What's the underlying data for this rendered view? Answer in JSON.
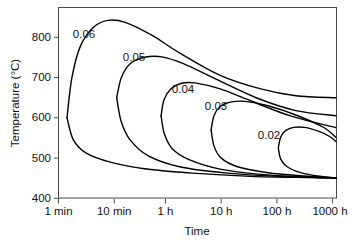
{
  "chart_data": {
    "type": "line",
    "title": "",
    "xlabel": "Time",
    "ylabel": "Temperature (°C)",
    "x_scale": "log",
    "x_tick_labels": [
      "1 min",
      "10 min",
      "1 h",
      "10 h",
      "100 h",
      "1000 h"
    ],
    "y_tick_labels": [
      "400",
      "500",
      "600",
      "700",
      "800"
    ],
    "y_tick_values": [
      400,
      500,
      600,
      700,
      800
    ],
    "ylim": [
      400,
      875
    ],
    "grid": false,
    "legend": "inline-curve-labels",
    "series": [
      {
        "name": "0.06",
        "label": "0.06",
        "label_position": {
          "time": "1 min",
          "temperature": 832
        },
        "nose_time": "1.4 min",
        "nose_temperature": 600,
        "peak_temperature": 843,
        "upper_branch_end_temperature": 650,
        "lower_branch_end_temperature": 450,
        "points_upper": [
          {
            "t": 1.4,
            "T": 600
          },
          {
            "t": 1.7,
            "T": 700
          },
          {
            "t": 2.4,
            "T": 780
          },
          {
            "t": 4.0,
            "T": 826
          },
          {
            "t": 7.0,
            "T": 843
          },
          {
            "t": 14.0,
            "T": 838
          },
          {
            "t": 40.0,
            "T": 806
          },
          {
            "t": 120.0,
            "T": 762
          },
          {
            "t": 600.0,
            "T": 706
          },
          {
            "t": 3000.0,
            "T": 672
          },
          {
            "t": 12000.0,
            "T": 655
          },
          {
            "t": 60000.0,
            "T": 650
          }
        ],
        "points_lower": [
          {
            "t": 1.4,
            "T": 600
          },
          {
            "t": 1.8,
            "T": 545
          },
          {
            "t": 3.0,
            "T": 512
          },
          {
            "t": 8.0,
            "T": 489
          },
          {
            "t": 30.0,
            "T": 473
          },
          {
            "t": 200.0,
            "T": 462
          },
          {
            "t": 2000.0,
            "T": 454
          },
          {
            "t": 20000.0,
            "T": 451
          },
          {
            "t": 60000.0,
            "T": 450
          }
        ]
      },
      {
        "name": "0.05",
        "label": "0.05",
        "label_position": {
          "time": "8 min",
          "temperature": 775
        },
        "nose_time": "10 min",
        "nose_temperature": 650,
        "peak_temperature": 752,
        "upper_branch_end_temperature": 605,
        "lower_branch_end_temperature": 450,
        "points_upper": [
          {
            "t": 10.0,
            "T": 650
          },
          {
            "t": 12.0,
            "T": 700
          },
          {
            "t": 17.0,
            "T": 735
          },
          {
            "t": 30.0,
            "T": 751
          },
          {
            "t": 60.0,
            "T": 752
          },
          {
            "t": 140.0,
            "T": 735
          },
          {
            "t": 500.0,
            "T": 697
          },
          {
            "t": 2500.0,
            "T": 650
          },
          {
            "t": 12000.0,
            "T": 618
          },
          {
            "t": 60000.0,
            "T": 605
          }
        ],
        "points_lower": [
          {
            "t": 10.0,
            "T": 650
          },
          {
            "t": 12.0,
            "T": 590
          },
          {
            "t": 17.0,
            "T": 545
          },
          {
            "t": 35.0,
            "T": 505
          },
          {
            "t": 120.0,
            "T": 478
          },
          {
            "t": 800.0,
            "T": 462
          },
          {
            "t": 6000.0,
            "T": 454
          },
          {
            "t": 60000.0,
            "T": 450
          }
        ]
      },
      {
        "name": "0.04",
        "label": "0.04",
        "label_position": {
          "time": "45 min",
          "temperature": 707
        },
        "nose_time": "1 h",
        "nose_temperature": 605,
        "peak_temperature": 687,
        "upper_branch_end_temperature": 575,
        "lower_branch_end_temperature": 450,
        "points_upper": [
          {
            "t": 58.0,
            "T": 605
          },
          {
            "t": 65.0,
            "T": 645
          },
          {
            "t": 85.0,
            "T": 672
          },
          {
            "t": 130.0,
            "T": 686
          },
          {
            "t": 220.0,
            "T": 687
          },
          {
            "t": 600.0,
            "T": 672
          },
          {
            "t": 2200.0,
            "T": 640
          },
          {
            "t": 10000.0,
            "T": 604
          },
          {
            "t": 60000.0,
            "T": 575
          }
        ],
        "points_lower": [
          {
            "t": 58.0,
            "T": 605
          },
          {
            "t": 66.0,
            "T": 560
          },
          {
            "t": 90.0,
            "T": 523
          },
          {
            "t": 180.0,
            "T": 495
          },
          {
            "t": 600.0,
            "T": 472
          },
          {
            "t": 3000.0,
            "T": 459
          },
          {
            "t": 20000.0,
            "T": 452
          },
          {
            "t": 60000.0,
            "T": 450
          }
        ]
      },
      {
        "name": "0.03",
        "label": "0.03",
        "label_position": {
          "time": "4 h",
          "temperature": 663
        },
        "nose_time": "7 h",
        "nose_temperature": 570,
        "peak_temperature": 641,
        "upper_branch_end_temperature": 550,
        "lower_branch_end_temperature": 450,
        "points_upper": [
          {
            "t": 420.0,
            "T": 570
          },
          {
            "t": 470.0,
            "T": 605
          },
          {
            "t": 600.0,
            "T": 628
          },
          {
            "t": 900.0,
            "T": 639
          },
          {
            "t": 1600.0,
            "T": 641
          },
          {
            "t": 4000.0,
            "T": 630
          },
          {
            "t": 12000.0,
            "T": 607
          },
          {
            "t": 35000.0,
            "T": 577
          },
          {
            "t": 60000.0,
            "T": 550
          }
        ],
        "points_lower": [
          {
            "t": 420.0,
            "T": 570
          },
          {
            "t": 470.0,
            "T": 530
          },
          {
            "t": 620.0,
            "T": 500
          },
          {
            "t": 1200.0,
            "T": 478
          },
          {
            "t": 4000.0,
            "T": 463
          },
          {
            "t": 16000.0,
            "T": 455
          },
          {
            "t": 60000.0,
            "T": 450
          }
        ]
      },
      {
        "name": "0.02",
        "label": "0.02",
        "label_position": {
          "time": "70 h",
          "temperature": 592
        },
        "nose_time": "100 h",
        "nose_temperature": 525,
        "peak_temperature": 576,
        "upper_branch_end_temperature": 540,
        "lower_branch_end_temperature": 450,
        "points_upper": [
          {
            "t": 6000.0,
            "T": 525
          },
          {
            "t": 6600.0,
            "T": 552
          },
          {
            "t": 8000.0,
            "T": 568
          },
          {
            "t": 11000.0,
            "T": 576
          },
          {
            "t": 17000.0,
            "T": 576
          },
          {
            "t": 30000.0,
            "T": 566
          },
          {
            "t": 45000.0,
            "T": 554
          },
          {
            "t": 60000.0,
            "T": 540
          }
        ],
        "points_lower": [
          {
            "t": 6000.0,
            "T": 525
          },
          {
            "t": 6600.0,
            "T": 497
          },
          {
            "t": 8500.0,
            "T": 478
          },
          {
            "t": 14000.0,
            "T": 464
          },
          {
            "t": 28000.0,
            "T": 455
          },
          {
            "t": 60000.0,
            "T": 450
          }
        ]
      }
    ]
  },
  "axes": {
    "y_title": "Temperature (°C)",
    "x_title": "Time",
    "y_ticks": [
      {
        "label": "800"
      },
      {
        "label": "700"
      },
      {
        "label": "600"
      },
      {
        "label": "500"
      },
      {
        "label": "400"
      }
    ],
    "x_ticks": [
      {
        "label": "1 min"
      },
      {
        "label": "10 min"
      },
      {
        "label": "1 h"
      },
      {
        "label": "10 h"
      },
      {
        "label": "100 h"
      },
      {
        "label": "1000 h"
      }
    ]
  },
  "curve_labels": [
    {
      "text": "0.06"
    },
    {
      "text": "0.05"
    },
    {
      "text": "0.04"
    },
    {
      "text": "0.03"
    },
    {
      "text": "0.02"
    }
  ],
  "colors": {
    "curve": "#000000",
    "axis": "#4a4a4a",
    "text": "#111111",
    "background": "#ffffff"
  }
}
